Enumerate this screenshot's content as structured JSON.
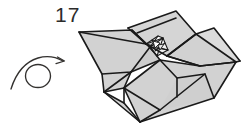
{
  "figure": {
    "kind": "origami-step-diagram",
    "step_number": "17",
    "background_color": "#ffffff",
    "paper_fill_color": "#d2d2d2",
    "paper_fill_shadow_color": "#bdbdbd",
    "paper_fill_highlight_color": "#e3e3e3",
    "line_color": "#1a1a1a",
    "symbol_color": "#33312f"
  },
  "labels": {
    "step_number": "17"
  },
  "symbols": {
    "turn_over_arrow": {
      "name": "turn-over-arrow",
      "meaning": "turn the model over",
      "color": "#33312f"
    }
  },
  "model": {
    "name": "folded-paper-model",
    "description": "shaded folded paper form with central pinwheel detail",
    "facets": [
      {
        "id": "left-upper-flap",
        "fill": "#d2d2d2"
      },
      {
        "id": "left-lower-flap",
        "fill": "#d2d2d2"
      },
      {
        "id": "top-raised-flap",
        "fill": "#d2d2d2"
      },
      {
        "id": "right-wing",
        "fill": "#d2d2d2"
      },
      {
        "id": "lower-body",
        "fill": "#d2d2d2"
      },
      {
        "id": "bottom-point",
        "fill": "#d2d2d2"
      },
      {
        "id": "center-pinwheel",
        "fill": "#ffffff"
      }
    ]
  }
}
